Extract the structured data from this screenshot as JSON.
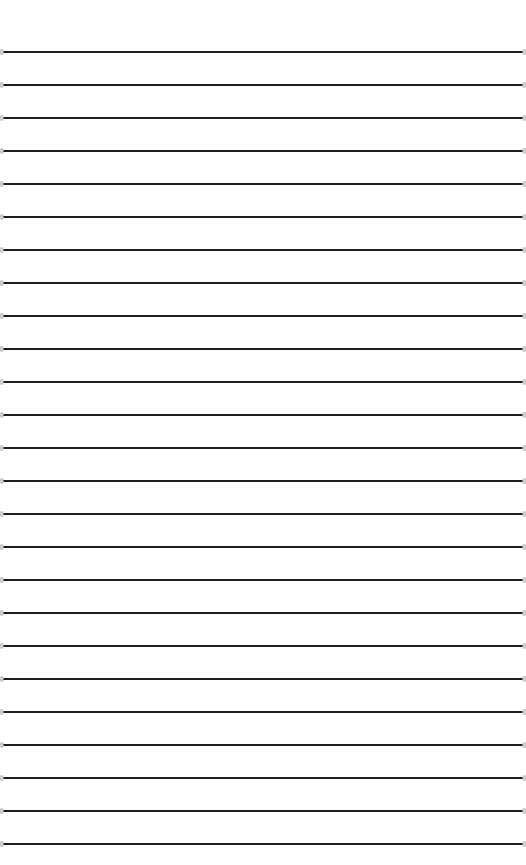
{
  "page": {
    "type": "lined-paper",
    "background_color": "#ffffff",
    "line_color": "#1e1e1e",
    "line_count": 25,
    "first_line_y": 52,
    "line_spacing": 33,
    "line_thickness": 2
  }
}
